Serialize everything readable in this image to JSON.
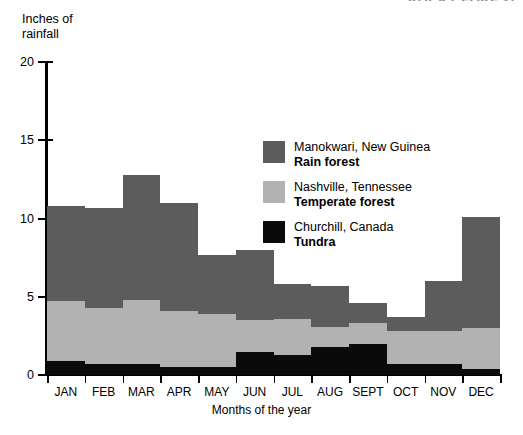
{
  "header": {
    "cropped_text": "ROCKY FOREST"
  },
  "axes": {
    "y_title": "Inches of\nrainfall",
    "y_ticks": [
      "20",
      "15",
      "10",
      "5",
      "0"
    ],
    "x_title": "Months of the year"
  },
  "legend": {
    "items": [
      {
        "place": "Manokwari, New Guinea",
        "biome": "Rain forest",
        "swatch": "rain",
        "color": "#5c5c5c"
      },
      {
        "place": "Nashville, Tennessee",
        "biome": "Temperate forest",
        "swatch": "temperate",
        "color": "#b2b2b2"
      },
      {
        "place": "Churchill, Canada",
        "biome": "Tundra",
        "swatch": "tundra",
        "color": "#0a0a0a"
      }
    ]
  },
  "chart_data": {
    "type": "bar",
    "subtype": "stacked",
    "title": "",
    "xlabel": "Months of the year",
    "ylabel": "Inches of rainfall",
    "ylim": [
      0,
      20
    ],
    "ytick_values": [
      0,
      5,
      10,
      15,
      20
    ],
    "grid": false,
    "legend_position": "inside-right",
    "categories": [
      "JAN",
      "FEB",
      "MAR",
      "APR",
      "MAY",
      "JUN",
      "JUL",
      "AUG",
      "SEPT",
      "OCT",
      "NOV",
      "DEC"
    ],
    "series": [
      {
        "name": "Churchill, Canada",
        "label": "Tundra",
        "color": "#0a0a0a",
        "values": [
          0.9,
          0.7,
          0.7,
          0.5,
          0.5,
          1.5,
          1.3,
          1.8,
          2.0,
          0.7,
          0.7,
          0.4
        ]
      },
      {
        "name": "Nashville, Tennessee",
        "label": "Temperate forest",
        "color": "#b2b2b2",
        "values": [
          4.7,
          4.3,
          4.8,
          4.1,
          3.9,
          3.5,
          3.6,
          3.1,
          3.3,
          2.8,
          2.8,
          3.0
        ]
      },
      {
        "name": "Manokwari, New Guinea",
        "label": "Rain forest",
        "color": "#5c5c5c",
        "values": [
          10.8,
          10.7,
          12.8,
          11.0,
          7.7,
          8.0,
          5.8,
          5.7,
          4.6,
          3.7,
          6.0,
          10.1
        ]
      }
    ],
    "totals": [
      10.8,
      10.7,
      12.8,
      11.0,
      7.7,
      8.0,
      5.8,
      5.7,
      4.6,
      3.7,
      6.0,
      10.1
    ]
  }
}
